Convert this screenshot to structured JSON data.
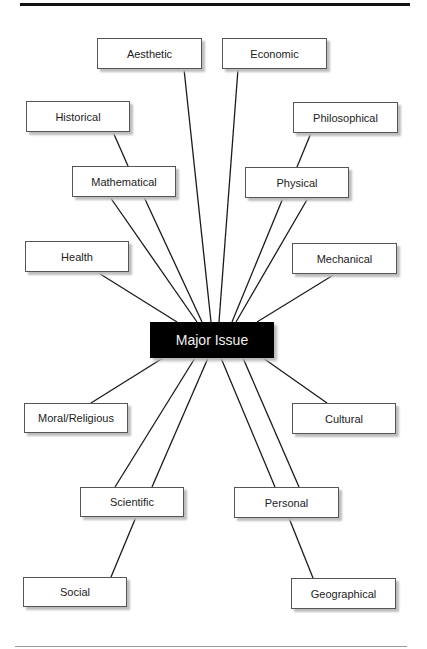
{
  "diagram": {
    "type": "concept-map",
    "center": {
      "id": "major",
      "label": "Major Issue",
      "x": 150,
      "y": 322,
      "w": 124,
      "h": 36
    },
    "nodes": [
      {
        "id": "aesthetic",
        "label": "Aesthetic",
        "x": 97,
        "y": 38,
        "w": 105,
        "h": 31
      },
      {
        "id": "economic",
        "label": "Economic",
        "x": 222,
        "y": 38,
        "w": 105,
        "h": 31
      },
      {
        "id": "historical",
        "label": "Historical",
        "x": 26,
        "y": 101,
        "w": 104,
        "h": 31
      },
      {
        "id": "philosophical",
        "label": "Philosophical",
        "x": 293,
        "y": 102,
        "w": 105,
        "h": 31
      },
      {
        "id": "mathematical",
        "label": "Mathematical",
        "x": 72,
        "y": 166,
        "w": 104,
        "h": 31
      },
      {
        "id": "physical",
        "label": "Physical",
        "x": 245,
        "y": 167,
        "w": 104,
        "h": 31
      },
      {
        "id": "health",
        "label": "Health",
        "x": 25,
        "y": 241,
        "w": 104,
        "h": 31
      },
      {
        "id": "mechanical",
        "label": "Mechanical",
        "x": 292,
        "y": 243,
        "w": 105,
        "h": 31
      },
      {
        "id": "moral",
        "label": "Moral/Religious",
        "x": 24,
        "y": 403,
        "w": 104,
        "h": 30
      },
      {
        "id": "cultural",
        "label": "Cultural",
        "x": 292,
        "y": 403,
        "w": 104,
        "h": 31
      },
      {
        "id": "scientific",
        "label": "Scientific",
        "x": 80,
        "y": 487,
        "w": 104,
        "h": 30
      },
      {
        "id": "personal",
        "label": "Personal",
        "x": 234,
        "y": 487,
        "w": 105,
        "h": 31
      },
      {
        "id": "social",
        "label": "Social",
        "x": 23,
        "y": 577,
        "w": 104,
        "h": 30
      },
      {
        "id": "geographical",
        "label": "Geographical",
        "x": 291,
        "y": 578,
        "w": 105,
        "h": 31
      }
    ],
    "edges": [
      {
        "from": "aesthetic",
        "to": "major",
        "x1": 184,
        "y1": 69,
        "x2": 211,
        "y2": 322
      },
      {
        "from": "economic",
        "to": "major",
        "x1": 238,
        "y1": 69,
        "x2": 219,
        "y2": 322
      },
      {
        "from": "historical",
        "to": "mathematical",
        "x1": 113,
        "y1": 132,
        "x2": 128,
        "y2": 166
      },
      {
        "from": "philosophical",
        "to": "physical",
        "x1": 311,
        "y1": 133,
        "x2": 297,
        "y2": 167
      },
      {
        "from": "mathematical",
        "to": "major",
        "x1": 110,
        "y1": 197,
        "x2": 197,
        "y2": 322
      },
      {
        "from": "mathematical",
        "to": "major",
        "x1": 144,
        "y1": 197,
        "x2": 202,
        "y2": 322
      },
      {
        "from": "physical",
        "to": "major",
        "x1": 283,
        "y1": 198,
        "x2": 232,
        "y2": 322
      },
      {
        "from": "physical",
        "to": "major",
        "x1": 308,
        "y1": 198,
        "x2": 236,
        "y2": 322
      },
      {
        "from": "health",
        "to": "major",
        "x1": 97,
        "y1": 272,
        "x2": 177,
        "y2": 322
      },
      {
        "from": "mechanical",
        "to": "major",
        "x1": 335,
        "y1": 274,
        "x2": 257,
        "y2": 322
      },
      {
        "from": "major",
        "to": "moral",
        "x1": 163,
        "y1": 358,
        "x2": 91,
        "y2": 403
      },
      {
        "from": "major",
        "to": "cultural",
        "x1": 263,
        "y1": 358,
        "x2": 327,
        "y2": 403
      },
      {
        "from": "major",
        "to": "scientific",
        "x1": 195,
        "y1": 358,
        "x2": 115,
        "y2": 487
      },
      {
        "from": "major",
        "to": "scientific",
        "x1": 208,
        "y1": 358,
        "x2": 152,
        "y2": 487
      },
      {
        "from": "major",
        "to": "personal",
        "x1": 221,
        "y1": 358,
        "x2": 275,
        "y2": 487
      },
      {
        "from": "major",
        "to": "personal",
        "x1": 243,
        "y1": 358,
        "x2": 299,
        "y2": 487
      },
      {
        "from": "scientific",
        "to": "social",
        "x1": 136,
        "y1": 517,
        "x2": 111,
        "y2": 577
      },
      {
        "from": "personal",
        "to": "geographical",
        "x1": 289,
        "y1": 518,
        "x2": 313,
        "y2": 578
      }
    ]
  }
}
